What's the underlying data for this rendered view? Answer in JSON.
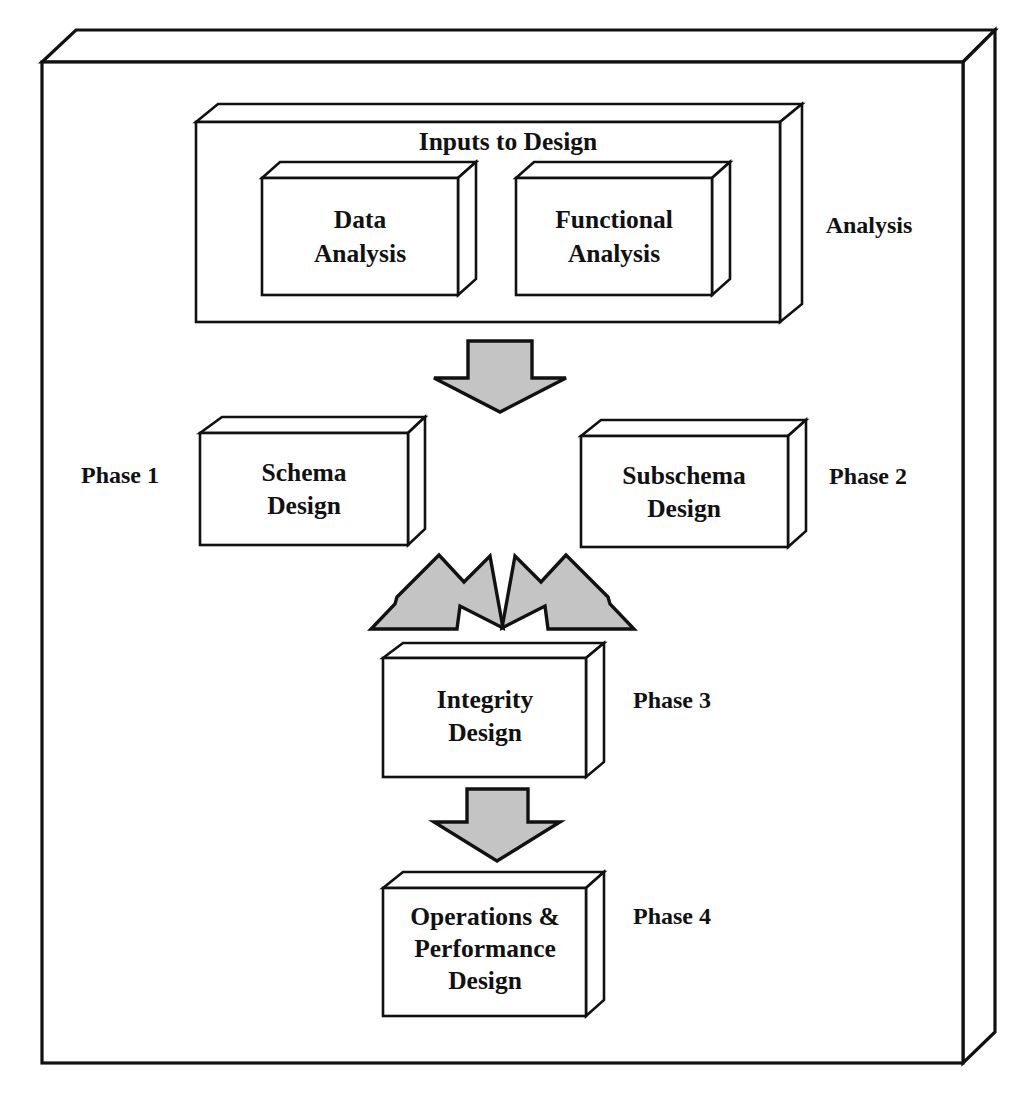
{
  "diagram": {
    "outer_frame": {
      "name": "outer-3d-slab"
    },
    "colors": {
      "outline": "#111111",
      "box_fill": "#ffffff",
      "arrow_fill": "#c4c4c4",
      "background": "#ffffff"
    },
    "inputs_container": {
      "title": "Inputs to Design",
      "side_label": "Analysis",
      "boxes": [
        {
          "label_line1": "Data",
          "label_line2": "Analysis"
        },
        {
          "label_line1": "Functional",
          "label_line2": "Analysis"
        }
      ]
    },
    "phases": [
      {
        "side_label": "Phase 1",
        "label_line1": "Schema",
        "label_line2": "Design",
        "label_line3": ""
      },
      {
        "side_label": "Phase 2",
        "label_line1": "Subschema",
        "label_line2": "Design",
        "label_line3": ""
      },
      {
        "side_label": "Phase 3",
        "label_line1": "Integrity",
        "label_line2": "Design",
        "label_line3": ""
      },
      {
        "side_label": "Phase 4",
        "label_line1": "Operations &",
        "label_line2": "Performance",
        "label_line3": "Design"
      }
    ],
    "arrows": [
      {
        "name": "arrow-inputs-to-schema",
        "direction": "down"
      },
      {
        "name": "arrow-schema-to-integrity",
        "direction": "down-right"
      },
      {
        "name": "arrow-subschema-to-integrity",
        "direction": "down-left"
      },
      {
        "name": "arrow-integrity-to-operations",
        "direction": "down"
      }
    ]
  }
}
